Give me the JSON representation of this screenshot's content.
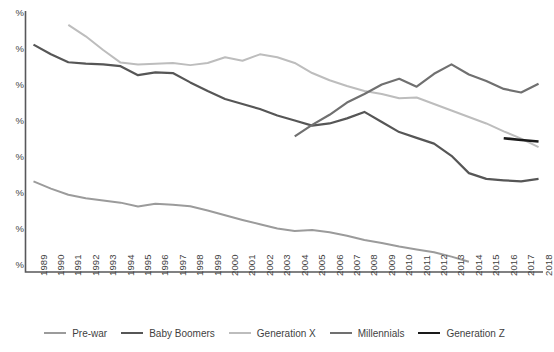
{
  "chart_data": {
    "type": "line",
    "title": "",
    "subtitle": "",
    "xlabel": "",
    "ylabel": "",
    "grid": false,
    "legend_position": "bottom",
    "x": [
      1989,
      1990,
      1991,
      1992,
      1993,
      1994,
      1995,
      1996,
      1997,
      1998,
      1999,
      2000,
      2001,
      2002,
      2003,
      2004,
      2005,
      2006,
      2007,
      2008,
      2009,
      2010,
      2011,
      2012,
      2013,
      2014,
      2015,
      2016,
      2017,
      2018
    ],
    "x_tick_labels": [
      "1989",
      "1990",
      "1991",
      "1992",
      "1993",
      "1994",
      "1995",
      "1996",
      "1997",
      "1998",
      "1999",
      "2000",
      "2001",
      "2002",
      "2003",
      "2004",
      "2005",
      "2006",
      "2007",
      "2008",
      "2009",
      "2010",
      "2011",
      "2012",
      "2013",
      "2014",
      "2015",
      "2016",
      "2017",
      "2018"
    ],
    "y_tick_labels": [
      "%",
      "%",
      "%",
      "%",
      "%",
      "%",
      "%",
      "%"
    ],
    "y_tick_note": "y-axis numeric values are cropped off the left edge of the screenshot; only the percent signs are visible",
    "ylim": [
      0,
      80
    ],
    "y_ticks": [
      80,
      70,
      60,
      50,
      40,
      30,
      20,
      10
    ],
    "series": [
      {
        "name": "Pre-war",
        "color": "#9b9b9b",
        "stroke_width": 2.0,
        "x": [
          1989,
          1990,
          1991,
          1992,
          1993,
          1994,
          1995,
          1996,
          1997,
          1998,
          1999,
          2000,
          2001,
          2002,
          2003,
          2004,
          2005,
          2006,
          2007,
          2008,
          2009,
          2010,
          2011,
          2012,
          2013,
          2014
        ],
        "values": [
          33.5,
          31.5,
          29.8,
          28.8,
          28.2,
          27.6,
          26.5,
          27.3,
          27.0,
          26.6,
          25.4,
          24.1,
          22.8,
          21.6,
          20.4,
          19.7,
          20.0,
          19.4,
          18.4,
          17.2,
          16.4,
          15.4,
          14.6,
          13.8,
          12.6,
          11.2
        ]
      },
      {
        "name": "Baby Boomers",
        "color": "#565656",
        "stroke_width": 2.2,
        "x": [
          1989,
          1990,
          1991,
          1992,
          1993,
          1994,
          1995,
          1996,
          1997,
          1998,
          1999,
          2000,
          2001,
          2002,
          2003,
          2004,
          2005,
          2006,
          2007,
          2008,
          2009,
          2010,
          2011,
          2012,
          2013,
          2014,
          2015,
          2016,
          2017,
          2018
        ],
        "values": [
          71.5,
          68.8,
          66.6,
          66.2,
          66.0,
          65.5,
          63.0,
          63.8,
          63.6,
          61.0,
          58.6,
          56.4,
          55.0,
          53.6,
          51.8,
          50.4,
          49.0,
          49.6,
          51.0,
          52.8,
          50.0,
          47.2,
          45.6,
          44.0,
          40.6,
          35.8,
          34.2,
          33.8,
          33.5,
          34.2
        ]
      },
      {
        "name": "Generation X",
        "color": "#bdbdbd",
        "stroke_width": 2.0,
        "x": [
          1991,
          1992,
          1993,
          1994,
          1995,
          1996,
          1997,
          1998,
          1999,
          2000,
          2001,
          2002,
          2003,
          2004,
          2005,
          2006,
          2007,
          2008,
          2009,
          2010,
          2011,
          2012,
          2013,
          2014,
          2015,
          2016,
          2017,
          2018
        ],
        "values": [
          77.0,
          73.8,
          70.0,
          66.5,
          66.0,
          66.2,
          66.4,
          65.8,
          66.4,
          68.0,
          67.0,
          68.8,
          68.0,
          66.4,
          63.6,
          61.6,
          60.0,
          58.6,
          57.8,
          56.6,
          56.8,
          55.0,
          53.2,
          51.4,
          49.6,
          47.4,
          45.4,
          43.0
        ]
      },
      {
        "name": "Millennials",
        "color": "#707070",
        "stroke_width": 2.2,
        "x": [
          2004,
          2005,
          2006,
          2007,
          2008,
          2009,
          2010,
          2011,
          2012,
          2013,
          2014,
          2015,
          2016,
          2017,
          2018
        ],
        "values": [
          46.0,
          49.2,
          52.0,
          55.4,
          57.8,
          60.4,
          62.0,
          59.8,
          63.4,
          66.0,
          63.2,
          61.4,
          59.2,
          58.2,
          60.6
        ]
      },
      {
        "name": "Generation Z",
        "color": "#1a1a1a",
        "stroke_width": 2.6,
        "x": [
          2016,
          2017,
          2018
        ],
        "values": [
          45.5,
          45.0,
          44.6
        ]
      }
    ]
  },
  "legend": {
    "items": [
      {
        "label": "Pre-war",
        "color": "#9b9b9b",
        "width": 2.0
      },
      {
        "label": "Baby Boomers",
        "color": "#565656",
        "width": 2.6
      },
      {
        "label": "Generation X",
        "color": "#bdbdbd",
        "width": 2.0
      },
      {
        "label": "Millennials",
        "color": "#707070",
        "width": 2.0
      },
      {
        "label": "Generation Z",
        "color": "#1a1a1a",
        "width": 2.8
      }
    ]
  },
  "axes": {
    "axis_color": "#58585a",
    "tick_label_color": "#3f3f3f"
  }
}
